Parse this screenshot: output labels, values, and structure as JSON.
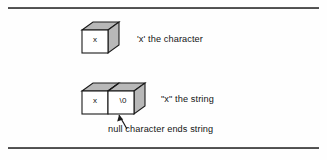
{
  "figure": {
    "background_color": "#fefefe",
    "rule_color": "#2a2a2a",
    "face_fill_front": "#ffffff",
    "face_fill_shaded": "#b8b8b8",
    "outline_color": "#1a1a1a"
  },
  "char_box": {
    "cells": [
      {
        "value": "x"
      }
    ],
    "caption": "'x' the character"
  },
  "string_box": {
    "cells": [
      {
        "value": "x"
      },
      {
        "value": "\\0"
      }
    ],
    "caption": "\"x\" the string"
  },
  "callout": {
    "text": "null character ends string",
    "arrow": "arrow-up-left"
  }
}
